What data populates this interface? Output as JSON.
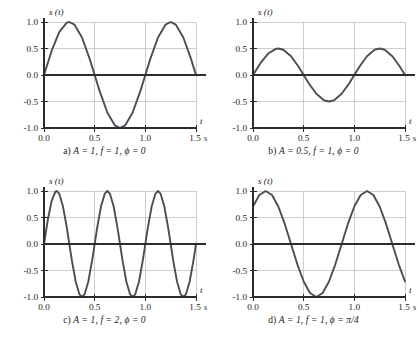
{
  "figure": {
    "title": "",
    "panels": [
      {
        "id": "a",
        "caption_prefix": "a)",
        "caption_amplitude": "A = 1,",
        "caption_frequency": "f = 1,",
        "caption_phase": "ϕ = 0",
        "caption_full": "a) A = 1, f = 1, ϕ = 0",
        "y_axis_label": "s (t)",
        "x_axis_label": "t",
        "x_unit": "s"
      },
      {
        "id": "b",
        "caption_prefix": "b)",
        "caption_amplitude": "A = 0.5,",
        "caption_frequency": "f = 1,",
        "caption_phase": "ϕ = 0",
        "caption_full": "b) A = 0.5, f = 1, ϕ = 0",
        "y_axis_label": "s (t)",
        "x_axis_label": "t",
        "x_unit": "s"
      },
      {
        "id": "c",
        "caption_prefix": "c)",
        "caption_amplitude": "A = 1,",
        "caption_frequency": "f = 2,",
        "caption_phase": "ϕ = 0",
        "caption_full": "c) A = 1, f = 2, ϕ = 0",
        "y_axis_label": "s (t)",
        "x_axis_label": "t",
        "x_unit": "s"
      },
      {
        "id": "d",
        "caption_prefix": "d)",
        "caption_amplitude": "A = 1,",
        "caption_frequency": "f = 1,",
        "caption_phase": "ϕ = π/4",
        "caption_full": "d) A = 1, f = 1, ϕ = π/4",
        "y_axis_label": "s (t)",
        "x_axis_label": "t",
        "x_unit": "s"
      }
    ],
    "colors": {
      "curve": "#4d4d55",
      "axis": "#2b2b30",
      "grid": "#b9b9be",
      "background": "#ffffff",
      "text": "#1a1a1a"
    }
  },
  "chart_data": [
    {
      "type": "line",
      "panel": "a",
      "title": "a) A = 1, f = 1, ϕ = 0",
      "xlabel": "t",
      "ylabel": "s (t)",
      "x_unit": "s",
      "xlim": [
        0.0,
        1.5
      ],
      "ylim": [
        -1.0,
        1.0
      ],
      "xticks": [
        0.0,
        0.5,
        1.0,
        1.5
      ],
      "xticklabels": [
        "0.0",
        "0.5",
        "1.0",
        "1.5"
      ],
      "yticks": [
        -1.0,
        -0.5,
        0.0,
        0.5,
        1.0
      ],
      "yticklabels": [
        "-1.0",
        "-0.5",
        "0.0",
        "0.5",
        "1.0"
      ],
      "grid": true,
      "legend": "none",
      "equation": "s(t) = A sin(2πft + ϕ)",
      "params": {
        "A": 1,
        "f": 1,
        "phi": 0
      },
      "x": [
        0.0,
        0.075,
        0.15,
        0.225,
        0.25,
        0.3,
        0.375,
        0.45,
        0.5,
        0.55,
        0.625,
        0.7,
        0.75,
        0.8,
        0.875,
        0.95,
        1.0,
        1.05,
        1.125,
        1.2,
        1.25,
        1.3,
        1.375,
        1.45,
        1.5
      ],
      "values": [
        0.0,
        0.454,
        0.809,
        0.988,
        1.0,
        0.951,
        0.707,
        0.309,
        0.0,
        -0.309,
        -0.707,
        -0.951,
        -1.0,
        -0.951,
        -0.707,
        -0.309,
        0.0,
        0.309,
        0.707,
        0.951,
        1.0,
        0.951,
        0.707,
        0.309,
        0.0
      ]
    },
    {
      "type": "line",
      "panel": "b",
      "title": "b) A = 0.5, f = 1, ϕ = 0",
      "xlabel": "t",
      "ylabel": "s (t)",
      "x_unit": "s",
      "xlim": [
        0.0,
        1.5
      ],
      "ylim": [
        -1.0,
        1.0
      ],
      "xticks": [
        0.0,
        0.5,
        1.0,
        1.5
      ],
      "xticklabels": [
        "0.0",
        "0.5",
        "1.0",
        "1.5"
      ],
      "yticks": [
        -1.0,
        -0.5,
        0.0,
        0.5,
        1.0
      ],
      "yticklabels": [
        "-1.0",
        "-0.5",
        "0.0",
        "0.5",
        "1.0"
      ],
      "grid": true,
      "legend": "none",
      "equation": "s(t) = A sin(2πft + ϕ)",
      "params": {
        "A": 0.5,
        "f": 1,
        "phi": 0
      },
      "x": [
        0.0,
        0.075,
        0.15,
        0.225,
        0.25,
        0.3,
        0.375,
        0.45,
        0.5,
        0.55,
        0.625,
        0.7,
        0.75,
        0.8,
        0.875,
        0.95,
        1.0,
        1.05,
        1.125,
        1.2,
        1.25,
        1.3,
        1.375,
        1.45,
        1.5
      ],
      "values": [
        0.0,
        0.227,
        0.405,
        0.494,
        0.5,
        0.476,
        0.354,
        0.155,
        0.0,
        -0.155,
        -0.354,
        -0.476,
        -0.5,
        -0.476,
        -0.354,
        -0.155,
        0.0,
        0.155,
        0.354,
        0.476,
        0.5,
        0.476,
        0.354,
        0.155,
        0.0
      ]
    },
    {
      "type": "line",
      "panel": "c",
      "title": "c) A = 1, f = 2, ϕ = 0",
      "xlabel": "t",
      "ylabel": "s (t)",
      "x_unit": "s",
      "xlim": [
        0.0,
        1.5
      ],
      "ylim": [
        -1.0,
        1.0
      ],
      "xticks": [
        0.0,
        0.5,
        1.0,
        1.5
      ],
      "xticklabels": [
        "0.0",
        "0.5",
        "1.0",
        "1.5"
      ],
      "yticks": [
        -1.0,
        -0.5,
        0.0,
        0.5,
        1.0
      ],
      "yticklabels": [
        "-1.0",
        "-0.5",
        "0.0",
        "0.5",
        "1.0"
      ],
      "grid": true,
      "legend": "none",
      "equation": "s(t) = A sin(2πft + ϕ)",
      "params": {
        "A": 1,
        "f": 2,
        "phi": 0
      },
      "x": [
        0.0,
        0.0375,
        0.075,
        0.1125,
        0.125,
        0.15,
        0.1875,
        0.225,
        0.25,
        0.275,
        0.3125,
        0.35,
        0.375,
        0.4,
        0.4375,
        0.475,
        0.5,
        0.525,
        0.5625,
        0.6,
        0.625,
        0.65,
        0.6875,
        0.725,
        0.75,
        0.775,
        0.8125,
        0.85,
        0.875,
        0.9,
        0.9375,
        0.975,
        1.0,
        1.025,
        1.0625,
        1.1,
        1.125,
        1.15,
        1.1875,
        1.225,
        1.25,
        1.275,
        1.3125,
        1.35,
        1.375,
        1.4,
        1.4375,
        1.475,
        1.5
      ],
      "values": [
        0.0,
        0.454,
        0.809,
        0.988,
        1.0,
        0.951,
        0.707,
        0.309,
        0.0,
        -0.309,
        -0.707,
        -0.951,
        -1.0,
        -0.951,
        -0.707,
        -0.309,
        0.0,
        0.309,
        0.707,
        0.951,
        1.0,
        0.951,
        0.707,
        0.309,
        0.0,
        -0.309,
        -0.707,
        -0.951,
        -1.0,
        -0.951,
        -0.707,
        -0.309,
        0.0,
        0.309,
        0.707,
        0.951,
        1.0,
        0.951,
        0.707,
        0.309,
        0.0,
        -0.309,
        -0.707,
        -0.951,
        -1.0,
        -0.951,
        -0.707,
        -0.309,
        0.0
      ]
    },
    {
      "type": "line",
      "panel": "d",
      "title": "d) A = 1, f = 1, ϕ = π/4",
      "xlabel": "t",
      "ylabel": "s (t)",
      "x_unit": "s",
      "xlim": [
        0.0,
        1.5
      ],
      "ylim": [
        -1.0,
        1.0
      ],
      "xticks": [
        0.0,
        0.5,
        1.0,
        1.5
      ],
      "xticklabels": [
        "0.0",
        "0.5",
        "1.0",
        "1.5"
      ],
      "yticks": [
        -1.0,
        -0.5,
        0.0,
        0.5,
        1.0
      ],
      "yticklabels": [
        "-1.0",
        "-0.5",
        "0.0",
        "0.5",
        "1.0"
      ],
      "grid": true,
      "legend": "none",
      "equation": "s(t) = A sin(2πft + ϕ)",
      "params": {
        "A": 1,
        "f": 1,
        "phi": 0.7853981634
      },
      "x": [
        0.0,
        0.0625,
        0.125,
        0.1875,
        0.25,
        0.3125,
        0.375,
        0.4375,
        0.5,
        0.5625,
        0.625,
        0.6875,
        0.75,
        0.8125,
        0.875,
        0.9375,
        1.0,
        1.0625,
        1.125,
        1.1875,
        1.25,
        1.3125,
        1.375,
        1.4375,
        1.5
      ],
      "values": [
        0.707,
        0.924,
        1.0,
        0.924,
        0.707,
        0.383,
        0.0,
        -0.383,
        -0.707,
        -0.924,
        -1.0,
        -0.924,
        -0.707,
        -0.383,
        0.0,
        0.383,
        0.707,
        0.924,
        1.0,
        0.924,
        0.707,
        0.383,
        0.0,
        -0.383,
        -0.707
      ]
    }
  ]
}
